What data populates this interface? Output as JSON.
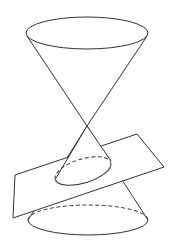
{
  "figure": {
    "caption": "",
    "colors": {
      "stroke": "#333333",
      "background": "#ffffff"
    },
    "shapes": {
      "upper_cone_rim": {
        "cx": 87,
        "cy": 33,
        "rx": 61,
        "ry": 16
      },
      "apex": {
        "x": 87,
        "y": 126
      },
      "bottom_cone_rim": {
        "cx": 88,
        "cy": 220,
        "rx": 60,
        "ry": 15,
        "back_half": "dashed"
      },
      "section_curve": {
        "cx": 83,
        "cy": 171,
        "rx": 29,
        "ry": 12,
        "rotation": -17,
        "back_half": "dashed"
      },
      "plane": {
        "corners": [
          [
            137,
            134
          ],
          [
            164,
            167
          ],
          [
            13,
            218
          ],
          [
            15,
            175
          ]
        ]
      }
    }
  }
}
